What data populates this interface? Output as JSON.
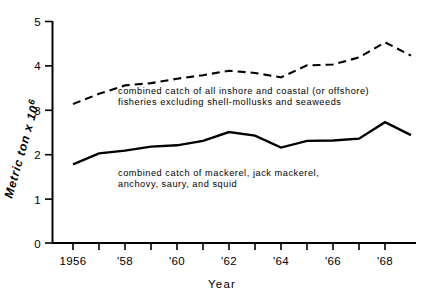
{
  "chart_data": {
    "type": "line",
    "title": "",
    "xlabel": "Year",
    "ylabel": "Metric ton x 10⁶",
    "xlim": [
      1956,
      1969.6
    ],
    "ylim": [
      0,
      5
    ],
    "grid": false,
    "legend_position": "inline-annotation",
    "y_ticks": [
      "0",
      "1",
      "2",
      "3",
      "4",
      "5"
    ],
    "y_tick_values": [
      0,
      1,
      2,
      3,
      4,
      5
    ],
    "x_ticks": [
      "1956",
      "'58",
      "'60",
      "'62",
      "'64",
      "'66",
      "'68"
    ],
    "x_tick_values": [
      1956,
      1958,
      1960,
      1962,
      1964,
      1966,
      1968
    ],
    "x_minor_tick_values": [
      1957,
      1959,
      1961,
      1963,
      1965,
      1967,
      1969
    ],
    "series": [
      {
        "name": "combined catch of all inshore and coastal (or offshore) fisheries excluding shell-mollusks and seaweeds",
        "style": "dashed",
        "color": "#000000",
        "x": [
          1956,
          1957,
          1958,
          1959,
          1960,
          1961,
          1962,
          1963,
          1964,
          1965,
          1966,
          1967,
          1968,
          1969
        ],
        "values": [
          3.13,
          3.36,
          3.55,
          3.6,
          3.7,
          3.78,
          3.88,
          3.83,
          3.73,
          4.0,
          4.02,
          4.18,
          4.52,
          4.22
        ]
      },
      {
        "name": "combined catch of mackerel, jack mackerel, anchovy, saury, and squid",
        "style": "solid",
        "color": "#000000",
        "x": [
          1956,
          1957,
          1958,
          1959,
          1960,
          1961,
          1962,
          1963,
          1964,
          1965,
          1966,
          1967,
          1968,
          1969
        ],
        "values": [
          1.77,
          2.02,
          2.08,
          2.17,
          2.2,
          2.3,
          2.5,
          2.42,
          2.15,
          2.3,
          2.31,
          2.35,
          2.72,
          2.43
        ]
      }
    ],
    "annotations": [
      {
        "id": "upper",
        "lines": [
          "combined catch of all  inshore and  coastal (or offshore)",
          "fisheries excluding shell-mollusks and  seaweeds"
        ]
      },
      {
        "id": "lower",
        "lines": [
          "combined catch of mackerel, jack mackerel,",
          "anchovy, saury, and  squid"
        ]
      }
    ]
  },
  "axes": {
    "y_title": "Metric ton x 10",
    "y_title_exp": "6",
    "x_title": "Year"
  },
  "colors": {
    "ink": "#000000",
    "background": "#ffffff"
  }
}
